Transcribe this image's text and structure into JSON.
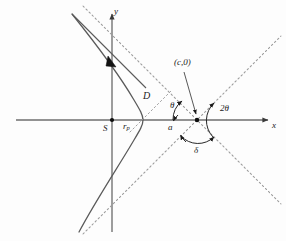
{
  "figure": {
    "type": "geometry-diagram",
    "width": 286,
    "height": 241,
    "background_color": "#fdfdfd",
    "stroke_color": "#5a5a5a",
    "axis_color": "#6e6e6e",
    "text_color": "#1b1b1b"
  },
  "axes": {
    "x_label": "x",
    "y_label": "y",
    "origin_x": 112,
    "origin_y": 120
  },
  "labels": {
    "focus": "S",
    "perihelion": "r",
    "perihelion_sub": "p",
    "impact_parameter": "D",
    "center_point": "(c,0)",
    "semi_axis": "a",
    "theta": "θ",
    "two_theta": "2θ",
    "delta": "δ"
  },
  "geometry": {
    "center_c_x": 197,
    "center_c_y": 120,
    "vertex_x": 143,
    "asymptote_slope": 1.0,
    "curve_opening": "right"
  }
}
